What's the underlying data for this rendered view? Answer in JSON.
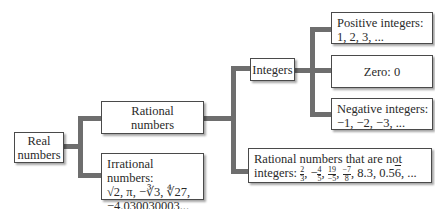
{
  "nodes": {
    "real": {
      "line1": "Real",
      "line2": "numbers"
    },
    "rational": {
      "line1": "Rational",
      "line2": "numbers"
    },
    "irrational": {
      "title": "Irrational numbers:",
      "ex1": "√2, π, −∛3, ∜27,",
      "ex2": "−4.030030003..., ..."
    },
    "integers": {
      "label": "Integers"
    },
    "positive": {
      "title": "Positive integers:",
      "examples": "1, 2, 3, ..."
    },
    "zero": {
      "label": "Zero: 0"
    },
    "negative": {
      "title": "Negative integers:",
      "examples": "−1, −2, −3, ..."
    },
    "non_integer_rational": {
      "title": "Rational numbers that are not",
      "prefix": "integers:",
      "fractions": [
        {
          "sign": "",
          "num": "2",
          "den": "3"
        },
        {
          "sign": "−",
          "num": "4",
          "den": "5"
        },
        {
          "sign": "",
          "num": "19",
          "den": "−5"
        },
        {
          "sign": "",
          "num": "−7",
          "den": "8"
        }
      ],
      "decimal1": "8.3",
      "decimal2_base": "0.5",
      "decimal2_repeat": "6",
      "tail": ", ..."
    }
  },
  "colors": {
    "connector": "#6e6e6e",
    "border": "#4a4a4a",
    "text": "#2a2a2a"
  }
}
